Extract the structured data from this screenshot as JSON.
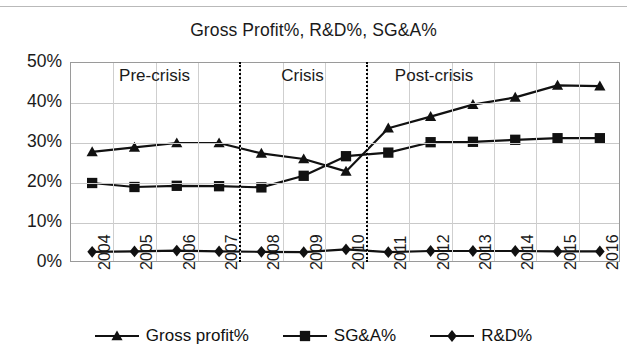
{
  "chart_data": {
    "type": "line",
    "title": "Gross Profit%, R&D%, SG&A%",
    "xlabel": "",
    "ylabel": "",
    "categories": [
      "2004",
      "2005",
      "2006",
      "2007",
      "2008",
      "2009",
      "2010",
      "2011",
      "2012",
      "2013",
      "2014",
      "2015",
      "2016"
    ],
    "ylim": [
      0,
      50
    ],
    "yticks": [
      "0%",
      "10%",
      "20%",
      "30%",
      "40%",
      "50%"
    ],
    "ytick_values": [
      0,
      10,
      20,
      30,
      40,
      50
    ],
    "grid": true,
    "legend_position": "bottom",
    "series": [
      {
        "name": "Gross profit%",
        "marker": "triangle",
        "values": [
          27.8,
          28.9,
          30.0,
          30.0,
          27.4,
          26.0,
          22.9,
          33.7,
          36.6,
          39.6,
          41.4,
          44.4,
          44.2
        ]
      },
      {
        "name": "SG&A%",
        "marker": "square",
        "values": [
          20.0,
          19.0,
          19.3,
          19.2,
          18.9,
          21.8,
          26.7,
          27.6,
          30.2,
          30.3,
          30.8,
          31.2,
          31.2
        ]
      },
      {
        "name": "R&D%",
        "marker": "diamond",
        "values": [
          2.8,
          2.9,
          3.1,
          2.9,
          2.8,
          2.7,
          3.4,
          2.7,
          3.0,
          3.0,
          3.0,
          2.9,
          2.9
        ]
      }
    ],
    "annotations": [
      {
        "label": "Pre-crisis",
        "x_center_year": 2005.6
      },
      {
        "label": "Crisis",
        "x_center_year": 2009.2
      },
      {
        "label": "Post-crisis",
        "x_center_year": 2012.2
      }
    ],
    "dividers": [
      {
        "between": "2007-2008"
      },
      {
        "between": "2010-2011"
      }
    ],
    "colors": {
      "series_line": "#111111",
      "gridline": "#c9c9c9",
      "axis": "#9a9a9a",
      "text": "#1a1a1a",
      "background": "#ffffff"
    }
  },
  "legend": {
    "items": [
      {
        "label": "Gross profit%",
        "marker": "triangle"
      },
      {
        "label": "SG&A%",
        "marker": "square"
      },
      {
        "label": "R&D%",
        "marker": "diamond"
      }
    ]
  }
}
